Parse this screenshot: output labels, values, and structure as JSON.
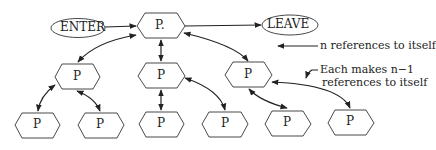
{
  "diagram": {
    "nodes": {
      "enter": "ENTER",
      "leave": "LEAVE",
      "top": "P.",
      "mid_left": "P",
      "mid_center": "P",
      "mid_right": "P",
      "bottom_1": "P",
      "bottom_2": "P",
      "bottom_3": "P",
      "bottom_4": "P",
      "bottom_5": "P",
      "bottom_6": "P"
    },
    "annotations": {
      "top_note": "n references to itself",
      "mid_note_line1": "Each makes n−1",
      "mid_note_line2": "references to itself"
    },
    "colors": {
      "stroke": "#222222",
      "background": "#ffffff"
    }
  }
}
